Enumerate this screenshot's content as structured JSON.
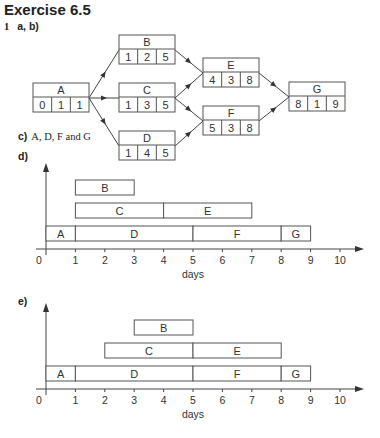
{
  "heading": "Exercise 6.5",
  "question_number": "1",
  "parts": {
    "ab": "a, b)",
    "c_label": "c)",
    "c_answer": "A, D, F and G",
    "d": "d)",
    "e": "e)"
  },
  "network": {
    "nodes": [
      {
        "id": "A",
        "values": [
          "0",
          "1",
          "1"
        ],
        "x": 33,
        "y": 83
      },
      {
        "id": "B",
        "values": [
          "1",
          "2",
          "5"
        ],
        "x": 119,
        "y": 35
      },
      {
        "id": "C",
        "values": [
          "1",
          "3",
          "5"
        ],
        "x": 119,
        "y": 83
      },
      {
        "id": "D",
        "values": [
          "1",
          "4",
          "5"
        ],
        "x": 119,
        "y": 131
      },
      {
        "id": "E",
        "values": [
          "4",
          "3",
          "8"
        ],
        "x": 203,
        "y": 58
      },
      {
        "id": "F",
        "values": [
          "5",
          "3",
          "8"
        ],
        "x": 203,
        "y": 106
      },
      {
        "id": "G",
        "values": [
          "8",
          "1",
          "9"
        ],
        "x": 289,
        "y": 82
      }
    ],
    "edges": [
      [
        "A",
        "B"
      ],
      [
        "A",
        "C"
      ],
      [
        "A",
        "D"
      ],
      [
        "B",
        "E"
      ],
      [
        "C",
        "E"
      ],
      [
        "C",
        "F"
      ],
      [
        "D",
        "F"
      ],
      [
        "E",
        "G"
      ],
      [
        "F",
        "G"
      ]
    ]
  },
  "chart_data": [
    {
      "type": "gantt",
      "title": "d)",
      "xlabel": "days",
      "ylabel": "",
      "xlim": [
        0,
        10
      ],
      "x_ticks": [
        "0",
        "1",
        "2",
        "3",
        "4",
        "5",
        "6",
        "7",
        "8",
        "9",
        "10"
      ],
      "rows": [
        [
          {
            "label": "A",
            "start": 0,
            "end": 1
          },
          {
            "label": "D",
            "start": 1,
            "end": 5
          },
          {
            "label": "F",
            "start": 5,
            "end": 8
          },
          {
            "label": "G",
            "start": 8,
            "end": 9
          }
        ],
        [
          {
            "label": "C",
            "start": 1,
            "end": 4
          },
          {
            "label": "E",
            "start": 4,
            "end": 7
          }
        ],
        [
          {
            "label": "B",
            "start": 1,
            "end": 3
          }
        ]
      ]
    },
    {
      "type": "gantt",
      "title": "e)",
      "xlabel": "days",
      "ylabel": "",
      "xlim": [
        0,
        10
      ],
      "x_ticks": [
        "0",
        "1",
        "2",
        "3",
        "4",
        "5",
        "6",
        "7",
        "8",
        "9",
        "10"
      ],
      "rows": [
        [
          {
            "label": "A",
            "start": 0,
            "end": 1
          },
          {
            "label": "D",
            "start": 1,
            "end": 5
          },
          {
            "label": "F",
            "start": 5,
            "end": 8
          },
          {
            "label": "G",
            "start": 8,
            "end": 9
          }
        ],
        [
          {
            "label": "C",
            "start": 2,
            "end": 5
          },
          {
            "label": "E",
            "start": 5,
            "end": 8
          }
        ],
        [
          {
            "label": "B",
            "start": 3,
            "end": 5
          }
        ]
      ]
    }
  ]
}
